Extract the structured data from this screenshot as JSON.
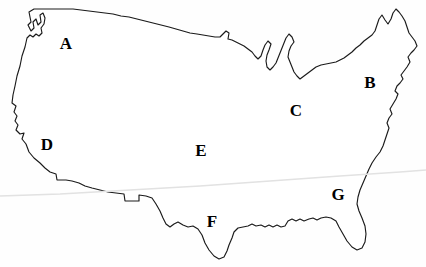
{
  "figure": {
    "background_color": "#fefefe",
    "outline_color": "#1a1a1a",
    "label_color": "#000000",
    "width": 426,
    "height": 267
  },
  "labels": [
    {
      "id": "label-a",
      "text": "A",
      "x": 66,
      "y": 43,
      "region": "pacific-northwest"
    },
    {
      "id": "label-b",
      "text": "B",
      "x": 370,
      "y": 82,
      "region": "northeast"
    },
    {
      "id": "label-c",
      "text": "C",
      "x": 296,
      "y": 110,
      "region": "great-lakes"
    },
    {
      "id": "label-d",
      "text": "D",
      "x": 47,
      "y": 144,
      "region": "california"
    },
    {
      "id": "label-e",
      "text": "E",
      "x": 201,
      "y": 150,
      "region": "great-plains"
    },
    {
      "id": "label-f",
      "text": "F",
      "x": 212,
      "y": 221,
      "region": "texas-gulf"
    },
    {
      "id": "label-g",
      "text": "G",
      "x": 338,
      "y": 194,
      "region": "southeast"
    }
  ],
  "outline": {
    "path": "M 29,12 L 31,22 L 28,25 L 31,31 L 34,28 L 33,22 L 36,19 L 38,25 L 41,22 L 40,15 L 43,13 L 45,18 L 44,24 L 41,28 L 42,33 L 39,36 L 36,34 L 33,37 L 30,35 L 27,38 L 25,47 L 22,56 L 20,66 L 17,76 L 15,86 L 13,95 L 12,103 L 16,106 L 14,112 L 17,116 L 15,121 L 18,125 L 16,130 L 20,134 L 24,133 L 22,139 L 26,144 L 29,152 L 34,158 L 40,163 L 45,168 L 50,172 L 56,174 L 57,180 L 62,180 L 66,180 L 72,181 L 79,183 L 85,186 L 92,188 L 100,190 L 108,192 L 116,193 L 124,194 L 125,201 L 132,201 L 139,201 L 139,195 L 146,196 L 152,198 L 156,204 L 160,211 L 163,218 L 166,224 L 170,227 L 174,224 L 178,222 L 183,225 L 188,227 L 193,226 L 198,229 L 202,235 L 205,243 L 209,250 L 214,256 L 219,259 L 224,257 L 227,251 L 229,245 L 232,238 L 234,232 L 238,228 L 243,227 L 248,226 L 252,224 L 256,226 L 261,225 L 265,227 L 269,225 L 273,227 L 277,225 L 281,227 L 285,226 L 288,221 L 292,219 L 296,221 L 300,219 L 304,221 L 309,219 L 313,218 L 317,220 L 321,218 L 326,217 L 331,218 L 336,221 L 339,227 L 343,234 L 347,241 L 352,247 L 357,250 L 362,248 L 365,242 L 366,234 L 365,226 L 362,218 L 359,211 L 357,204 L 358,197 L 360,190 L 363,183 L 366,176 L 369,169 L 372,163 L 376,157 L 380,152 L 383,146 L 385,140 L 387,134 L 389,128 L 387,123 L 389,118 L 392,114 L 390,109 L 393,104 L 396,99 L 398,94 L 395,91 L 397,86 L 400,83 L 403,79 L 401,75 L 404,71 L 407,67 L 410,62 L 408,57 L 411,53 L 414,50 L 417,46 L 415,41 L 412,37 L 409,33 L 407,27 L 405,21 L 402,16 L 399,12 L 396,9 L 393,13 L 391,19 L 388,24 L 385,20 L 382,15 L 379,19 L 377,25 L 375,31 L 372,35 L 368,38 L 364,41 L 360,45 L 356,48 L 352,52 L 348,55 L 344,58 L 340,60 L 336,62 L 331,63 L 326,64 L 321,65 L 316,67 L 312,70 L 308,73 L 304,76 L 300,79 L 297,76 L 294,72 L 292,67 L 290,62 L 288,57 L 289,51 L 291,46 L 294,42 L 292,37 L 289,34 L 286,38 L 284,43 L 282,48 L 280,53 L 278,58 L 276,63 L 273,67 L 270,70 L 267,67 L 266,61 L 267,55 L 269,50 L 271,44 L 268,41 L 265,45 L 263,50 L 261,56 L 258,59 L 255,56 L 252,52 L 248,49 L 244,46 L 240,44 L 236,42 L 232,40 L 228,39 L 229,33 L 226,31 L 223,34 L 220,37 L 215,37 L 209,36 L 203,35 L 197,34 L 190,33 L 183,31 L 176,29 L 169,27 L 161,25 L 153,23 L 145,21 L 137,19 L 129,17 L 121,16 L 113,14 L 105,13 L 97,12 L 89,11 L 81,10 L 73,9 L 65,9 L 57,9 L 49,9 L 41,9 L 34,9 Z",
    "description": "continental united states border including pacific coast, canadian border, great lakes, atlantic coast, florida peninsula, gulf coast and mexican border"
  },
  "scan_artifact": {
    "path": "M 0,196 L 60,194 L 130,190 L 200,186 L 270,181 L 340,176 L 400,172 L 426,170",
    "color": "#e2e2e2"
  }
}
